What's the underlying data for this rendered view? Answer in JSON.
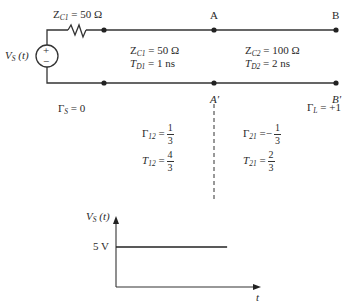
{
  "circuit": {
    "source": {
      "label": "V",
      "label_sub": "S",
      "label_arg": "(t)",
      "plus_sign": "+",
      "minus_sign": "−"
    },
    "source_resistor": {
      "label": "Z",
      "label_sub": "C1",
      "value": "= 50 Ω"
    },
    "line1": {
      "z_label": "Z",
      "z_sub": "C1",
      "z_value": "= 50 Ω",
      "t_label": "T",
      "t_sub": "D1",
      "t_value": "= 1 ns"
    },
    "line2": {
      "z_label": "Z",
      "z_sub": "C2",
      "z_value": "= 100 Ω",
      "t_label": "T",
      "t_sub": "D2",
      "t_value": "= 2 ns"
    },
    "nodes": {
      "A": "A",
      "B": "B",
      "A_prime": "A′",
      "B_prime": "B′"
    },
    "coefficients": {
      "gamma_s": {
        "symbol": "Γ",
        "sub": "S",
        "value": "= 0"
      },
      "gamma_l": {
        "symbol": "Γ",
        "sub": "L",
        "value": "= +1"
      },
      "gamma_12": {
        "symbol": "Γ",
        "sub": "12",
        "eq": "=",
        "sign": "",
        "num": "1",
        "den": "3"
      },
      "t_12": {
        "symbol": "T",
        "sub": "12",
        "eq": "=",
        "sign": "",
        "num": "4",
        "den": "3"
      },
      "gamma_21": {
        "symbol": "Γ",
        "sub": "21",
        "eq": "=",
        "sign": "−",
        "num": "1",
        "den": "3"
      },
      "t_21": {
        "symbol": "T",
        "sub": "21",
        "eq": "=",
        "sign": "",
        "num": "2",
        "den": "3"
      }
    }
  },
  "chart_data": {
    "type": "line",
    "title": "",
    "ylabel": "V",
    "ylabel_sub": "S",
    "ylabel_arg": "(t)",
    "xlabel": "t",
    "y_tick_labels": [
      "5 V"
    ],
    "series": [
      {
        "name": "V_S(t)",
        "x": [
          0,
          1
        ],
        "y": [
          5,
          5
        ]
      }
    ],
    "xlim": [
      0,
      1.26
    ],
    "ylim": [
      0,
      8
    ],
    "grid": false
  }
}
